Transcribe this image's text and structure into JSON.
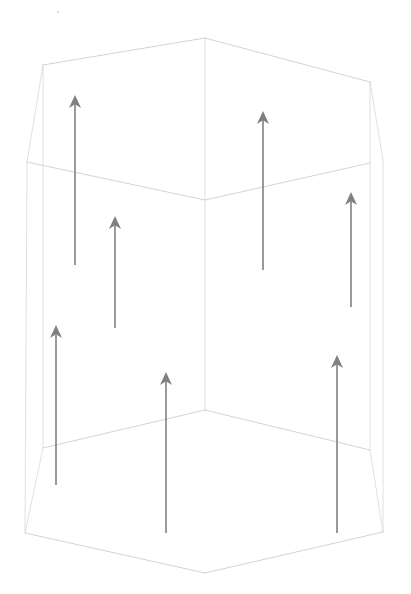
{
  "figure": {
    "background_color": "#ffffff",
    "canvas": {
      "width": 411,
      "height": 594
    }
  },
  "solid": {
    "name": "hexagonal-prism",
    "edge_color": "#c8c8c8",
    "edge_color_faint": "#d8d8d8",
    "edge_width": 0.8,
    "fill": "none",
    "vertices": {
      "top_apex": [
        205,
        38
      ],
      "top_left": [
        43,
        65
      ],
      "top_right": [
        370,
        82
      ],
      "mid_left": [
        27,
        162
      ],
      "mid_center": [
        205,
        200
      ],
      "mid_right": [
        370,
        163
      ],
      "upper_right_outer": [
        383,
        160
      ],
      "bottom_rim_center": [
        205,
        410
      ],
      "bottom_rim_left": [
        43,
        448
      ],
      "bottom_rim_right": [
        370,
        450
      ],
      "base_left": [
        25,
        533
      ],
      "base_center": [
        205,
        573
      ],
      "base_right": [
        383,
        532
      ]
    },
    "edges": [
      {
        "name": "top-face-left-ridge",
        "path": "M 205 38 L 43 65"
      },
      {
        "name": "top-face-right-ridge",
        "path": "M 205 38 L 370 82"
      },
      {
        "name": "top-rim-left",
        "path": "M 27 162 L 205 200"
      },
      {
        "name": "top-rim-right",
        "path": "M 205 200 L 370 163"
      },
      {
        "name": "top-left-bevel",
        "path": "M 43 65 L 27 162"
      },
      {
        "name": "top-right-bevel",
        "path": "M 370 82 L 383 160"
      },
      {
        "name": "center-vertical-edge",
        "path": "M 205 38 L 205 410"
      },
      {
        "name": "left-inner-vertical-edge",
        "path": "M 43 65 L 43 448"
      },
      {
        "name": "right-inner-vertical-edge",
        "path": "M 370 82 L 370 450"
      },
      {
        "name": "left-outer-silhouette",
        "path": "M 27 162 L 25 533"
      },
      {
        "name": "right-outer-silhouette",
        "path": "M 383 160 L 383 532"
      },
      {
        "name": "bottom-rim-left",
        "path": "M 43 448 L 205 410"
      },
      {
        "name": "bottom-rim-right",
        "path": "M 205 410 L 370 450"
      },
      {
        "name": "bottom-left-bevel",
        "path": "M 43 448 L 25 533"
      },
      {
        "name": "bottom-right-bevel",
        "path": "M 370 450 L 383 532"
      },
      {
        "name": "base-edge-left",
        "path": "M 25 533 L 205 573"
      },
      {
        "name": "base-edge-right",
        "path": "M 205 573 L 383 532"
      }
    ]
  },
  "arrows": {
    "color": "#808080",
    "shaft_width": 1.6,
    "head_length": 13,
    "head_half_width": 6,
    "direction": "up",
    "count": 6,
    "items": [
      {
        "name": "arrow-upper-left",
        "x": 75,
        "tail_y": 265,
        "tip_y": 95
      },
      {
        "name": "arrow-mid-left",
        "x": 115,
        "tail_y": 328,
        "tip_y": 216
      },
      {
        "name": "arrow-lower-left",
        "x": 56,
        "tail_y": 485,
        "tip_y": 325
      },
      {
        "name": "arrow-bottom-center",
        "x": 166,
        "tail_y": 533,
        "tip_y": 372
      },
      {
        "name": "arrow-upper-right",
        "x": 263,
        "tail_y": 270,
        "tip_y": 111
      },
      {
        "name": "arrow-mid-right",
        "x": 351,
        "tail_y": 307,
        "tip_y": 192
      },
      {
        "name": "arrow-lower-right",
        "x": 337,
        "tail_y": 533,
        "tip_y": 355
      }
    ]
  },
  "marks": {
    "speck": {
      "name": "stray-speck",
      "x": 58,
      "y": 12,
      "r": 1.1,
      "color": "#cfcfcf"
    }
  }
}
